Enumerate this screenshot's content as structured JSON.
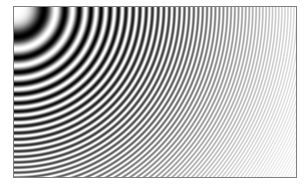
{
  "figure": {
    "width": 308,
    "height": 187,
    "background_color": "#ffffff"
  },
  "frame": {
    "left": 13,
    "top": 6,
    "width": 284,
    "height": 172,
    "border_width": 1,
    "border_color": "#808080",
    "fill_color": "#ffffff"
  },
  "plot_area": {
    "left": 14,
    "top": 7,
    "width": 282,
    "height": 170
  },
  "chart_data": {
    "type": "heatmap",
    "subtitle": "Concentric chirp rings centred at upper-left corner",
    "xlabel": "",
    "ylabel": "",
    "grid": false,
    "legend": "none",
    "colormap": "grayscale",
    "colormap_low": "#000000",
    "colormap_high": "#ffffff",
    "function": "0.5 + 0.5*cos(k*r^2)",
    "formula_constant_k": 0.00385,
    "center_x": 1,
    "center_y": 1,
    "amplitude": 0.5,
    "offset": 0.5,
    "sampling": "point",
    "nyquist_note": "ring frequency exceeds pixel Nyquist toward right edge producing moire",
    "radial_falloff_start": 60,
    "radial_falloff_end": 330,
    "contrast_at_origin": 1.0,
    "contrast_at_far_edge": 0.06,
    "x": [
      0,
      282
    ],
    "y": [
      0,
      170
    ],
    "xlim": [
      0,
      282
    ],
    "ylim": [
      0,
      170
    ],
    "moire_centers": [
      {
        "label": "primary-origin",
        "x": 1,
        "y": 1
      },
      {
        "label": "alias-ghost-upper-right",
        "x": 198,
        "y": 13
      },
      {
        "label": "alias-ghost-lower-left",
        "x": 94,
        "y": 108
      }
    ],
    "measured_mean_luminance": {
      "left_band": 0.52,
      "middle_band": 0.88,
      "right_band": 0.97
    }
  }
}
